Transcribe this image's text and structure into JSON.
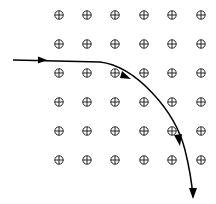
{
  "diagram": {
    "field": {
      "symbol": "circled-plus",
      "direction": "into-page",
      "columns_x": [
        59,
        87,
        115,
        144,
        172,
        201
      ],
      "rows_y": [
        15,
        44,
        73,
        102,
        131,
        160
      ]
    },
    "trajectory": {
      "entry": {
        "x": 13,
        "y": 60
      },
      "arrows": [
        {
          "x": 45,
          "y": 60
        },
        {
          "x": 128,
          "y": 78
        },
        {
          "x": 178,
          "y": 143
        },
        {
          "x": 193,
          "y": 197
        }
      ],
      "color": "#000000"
    }
  }
}
